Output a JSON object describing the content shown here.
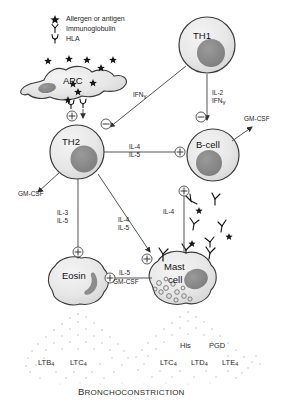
{
  "legend": {
    "items": [
      {
        "symbol": "star",
        "label": "Allergen or antigen"
      },
      {
        "symbol": "y-shape",
        "label": "Immunoglobulin"
      },
      {
        "symbol": "hla-shape",
        "label": "HLA"
      }
    ]
  },
  "cells": {
    "apc": "APC",
    "th1": "TH1",
    "th2": "TH2",
    "bcell": "B-cell",
    "eosin": "Eosin",
    "mast_line1": "Mast",
    "mast_line2": "cell"
  },
  "signals": {
    "ifn_gamma": "IFN",
    "gamma": "γ",
    "il2": "IL-2",
    "ifn2": "IFN",
    "gm_csf_th2": "GM-CSF",
    "gm_csf_bcell": "GM-CSF",
    "il4_bcell": "IL-4",
    "il5_bcell": "IL-5",
    "il3_eos": "IL-3",
    "il5_eos": "IL-5",
    "il4_mast": "IL-4",
    "il5_mast": "IL-5",
    "il4_ige": "IL-4",
    "il5_cross": "IL-5",
    "gm_csf_cross": "GM-CSF"
  },
  "mediators": {
    "left": [
      "LTB",
      "LTC"
    ],
    "left_sub": [
      "4",
      "4"
    ],
    "right_top": [
      "His",
      "PGD"
    ],
    "right": [
      "LTC",
      "LTD",
      "LTE"
    ],
    "right_sub": [
      "4",
      "4",
      "4"
    ]
  },
  "caption": {
    "first_letter": "B",
    "rest": "RONCHOCONSTRICTION"
  },
  "symbols": {
    "plus": "⊕",
    "minus": "⊖"
  },
  "colors": {
    "cell_fill": "#e9e9e9",
    "nucleus": "#8d8d8d",
    "outline": "#3a3a3a",
    "line": "#4a4a4a",
    "text": "#1a1a1a",
    "spray": "#b9b9b9"
  }
}
